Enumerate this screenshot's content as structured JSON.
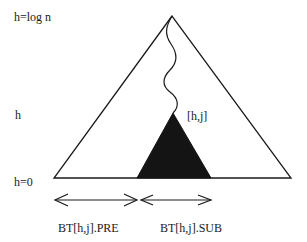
{
  "diagram": {
    "levels": {
      "top": "h=log n",
      "middle": "h",
      "bottom": "h=0"
    },
    "node_label": "[h,j]",
    "ranges": {
      "pre": "BT[h,j].PRE",
      "sub": "BT[h,j].SUB"
    },
    "colors": {
      "stroke": "#1a1a1a",
      "subtree_fill": "#141414",
      "background": "#ffffff"
    }
  }
}
